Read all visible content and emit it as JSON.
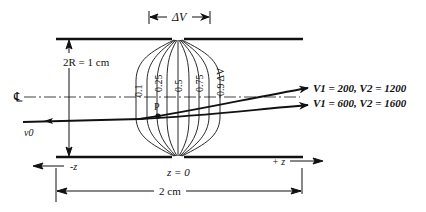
{
  "diagram": {
    "delta_v_label": "ΔV",
    "radius_label": "2R = 1 cm",
    "centerline_symbol": "℄",
    "beam_label": "v0",
    "point_label": "P",
    "equipotentials": [
      "0.1",
      "0.25",
      "0.5",
      "0.75",
      "0.9 ΔV"
    ],
    "trajectories": [
      {
        "label": "V1 = 200,  V2 = 1200",
        "v1": 200,
        "v2": 1200
      },
      {
        "label": "V1 = 600,  V2 = 1600",
        "v1": 600,
        "v2": 1600
      }
    ],
    "neg_z_label": "-z",
    "pos_z_label": "+ z",
    "origin_label": "z = 0",
    "length_label": "2 cm"
  }
}
